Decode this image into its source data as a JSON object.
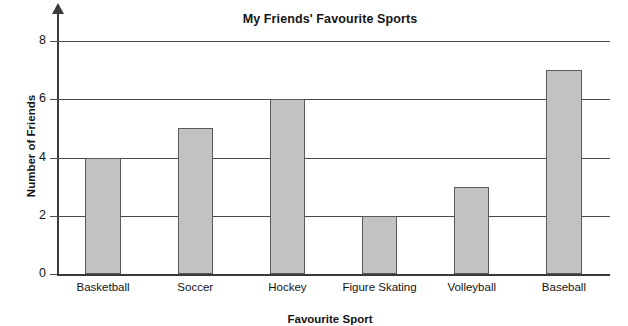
{
  "chart_data": {
    "type": "bar",
    "title": "My Friends' Favourite Sports",
    "xlabel": "Favourite Sport",
    "ylabel": "Number of Friends",
    "categories": [
      "Basketball",
      "Soccer",
      "Hockey",
      "Figure Skating",
      "Volleyball",
      "Baseball"
    ],
    "values": [
      4,
      5,
      6,
      2,
      3,
      7
    ],
    "ylim": [
      0,
      9
    ],
    "yticks": [
      0,
      2,
      4,
      6,
      8
    ],
    "ytick_labels": [
      "0",
      "2",
      "4",
      "6",
      "8"
    ],
    "grid": true,
    "legend": "none",
    "bar_fill_color": "#c2c2c2",
    "bar_edge_color": "#5a5a5a",
    "axis_color": "#3a3a3a"
  }
}
